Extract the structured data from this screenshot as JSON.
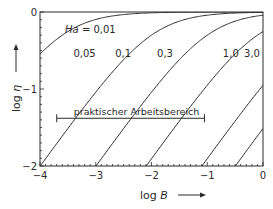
{
  "chart_data": {
    "type": "line",
    "title": "",
    "xlabel": "log B",
    "ylabel": "log η",
    "xlim": [
      -4,
      0
    ],
    "ylim": [
      -2,
      0
    ],
    "x_ticks": [
      "-4",
      "-3",
      "-2",
      "-1",
      "0"
    ],
    "y_ticks": [
      "0",
      "-1",
      "-2"
    ],
    "grid": false,
    "legend": "inline labels",
    "param_name": "Ha",
    "series": [
      {
        "name": "Ha = 0,01",
        "label": "Ha = 0,01",
        "logB0": -3.6,
        "label_pos": {
          "logB": -3.55,
          "logEta": -0.27
        }
      },
      {
        "name": "0,05",
        "label": "0,05",
        "logB0": -2.0,
        "label_pos": {
          "logB": -3.4,
          "logEta": -0.58
        }
      },
      {
        "name": "0,1",
        "label": "0,1",
        "logB0": -1.0,
        "label_pos": {
          "logB": -2.65,
          "logEta": -0.58
        }
      },
      {
        "name": "0,3",
        "label": "0,3",
        "logB0": -0.1,
        "label_pos": {
          "logB": -1.9,
          "logEta": -0.58
        }
      },
      {
        "name": "1,0",
        "label": "1,0",
        "logB0": 0.9,
        "label_pos": {
          "logB": -0.72,
          "logEta": -0.58
        }
      },
      {
        "name": "3,0",
        "label": "3,0",
        "logB0": 1.5,
        "label_pos": {
          "logB": -0.34,
          "logEta": -0.58
        }
      }
    ],
    "annotations": [
      {
        "text": "praktischer Arbeitsbereich",
        "type": "range-arrow",
        "logB_from": -3.7,
        "logB_to": -1.05,
        "logEta": -1.38
      }
    ]
  },
  "axes": {
    "x_title_prefix": "log ",
    "x_title_var": "B",
    "y_title_prefix": "log ",
    "y_title_var": "η"
  },
  "annotation": {
    "range_text": "praktischer Arbeitsbereich"
  }
}
